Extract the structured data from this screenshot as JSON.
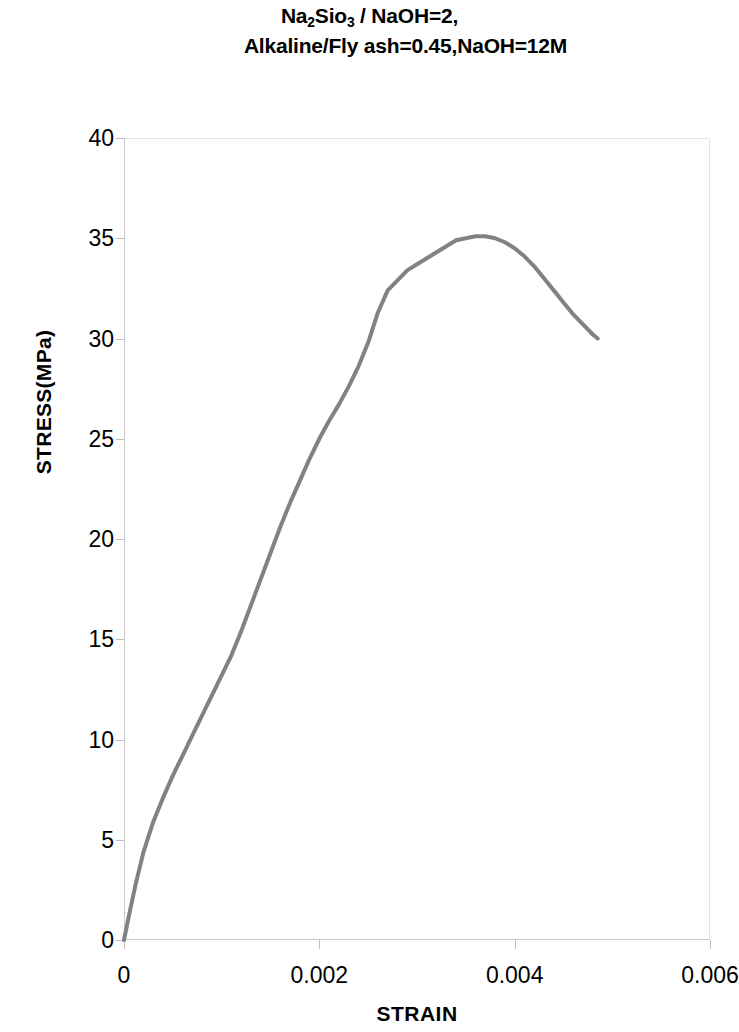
{
  "title": {
    "line1_prefix": "Na",
    "line1_sub1": "2",
    "line1_mid": "Sio",
    "line1_sub2": "3",
    "line1_suffix": " / NaOH=2,",
    "line2": "Alkaline/Fly ash=0.45,NaOH=12M",
    "full": "Na2Sio3 / NaOH=2, Alkaline/Fly ash=0.45,NaOH=12M"
  },
  "axes": {
    "x_title": "STRAIN",
    "y_title": "STRESS(MPa)"
  },
  "chart_data": {
    "type": "line",
    "title": "Na2Sio3 / NaOH=2, Alkaline/Fly ash=0.45,NaOH=12M",
    "xlabel": "STRAIN",
    "ylabel": "STRESS(MPa)",
    "xlim": [
      0,
      0.006
    ],
    "ylim": [
      0,
      40
    ],
    "xticks": [
      0,
      0.002,
      0.004,
      0.006
    ],
    "xtick_labels": [
      "0",
      "0.002",
      "0.004",
      "0.006"
    ],
    "yticks": [
      0,
      5,
      10,
      15,
      20,
      25,
      30,
      35,
      40
    ],
    "ytick_labels": [
      "0",
      "5",
      "10",
      "15",
      "20",
      "25",
      "30",
      "35",
      "40"
    ],
    "grid": false,
    "legend": "none",
    "series": [
      {
        "name": "stress-strain curve",
        "color": "#828282",
        "line_width": 4,
        "x": [
          0.0,
          5e-05,
          0.00012,
          0.0002,
          0.0003,
          0.0004,
          0.0005,
          0.0006,
          0.0007,
          0.0008,
          0.0009,
          0.001,
          0.0011,
          0.0012,
          0.0013,
          0.0014,
          0.0015,
          0.0016,
          0.0017,
          0.0018,
          0.0019,
          0.002,
          0.0021,
          0.0022,
          0.0023,
          0.0024,
          0.0025,
          0.0026,
          0.0027,
          0.0028,
          0.0029,
          0.003,
          0.0031,
          0.0032,
          0.0033,
          0.0034,
          0.0035,
          0.0036,
          0.0037,
          0.0038,
          0.0039,
          0.004,
          0.0041,
          0.0042,
          0.0043,
          0.0044,
          0.0045,
          0.0046,
          0.0047,
          0.0048,
          0.00485
        ],
        "y": [
          0.0,
          1.2,
          2.8,
          4.4,
          5.9,
          7.1,
          8.2,
          9.2,
          10.2,
          11.2,
          12.2,
          13.2,
          14.2,
          15.4,
          16.7,
          18.0,
          19.3,
          20.6,
          21.8,
          22.9,
          24.0,
          25.0,
          25.9,
          26.7,
          27.6,
          28.6,
          29.8,
          31.3,
          32.4,
          32.9,
          33.4,
          33.7,
          34.0,
          34.3,
          34.6,
          34.9,
          35.0,
          35.1,
          35.1,
          35.0,
          34.8,
          34.5,
          34.1,
          33.6,
          33.0,
          32.4,
          31.8,
          31.2,
          30.7,
          30.2,
          30.0
        ],
        "peak": {
          "strain": 0.0037,
          "stress": 35.1
        },
        "endpoint": {
          "strain": 0.00485,
          "stress": 30.0
        }
      }
    ]
  },
  "colors": {
    "curve": "#828282",
    "axis": "#c9c9c9",
    "text": "#000000",
    "background": "#ffffff"
  }
}
